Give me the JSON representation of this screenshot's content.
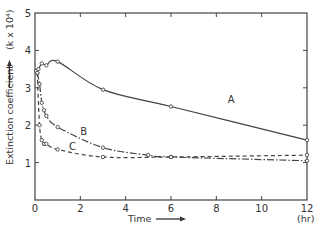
{
  "chart_data": {
    "type": "line",
    "title": "",
    "xlabel": "Time",
    "xunit": "(hr)",
    "ylabel": "Extinction coefficient",
    "yunit": "(k x 10⁴)",
    "xlim": [
      0,
      12
    ],
    "ylim": [
      0,
      5
    ],
    "xticks": [
      0,
      2,
      4,
      6,
      8,
      10,
      12
    ],
    "yticks": [
      1,
      2,
      3,
      4,
      5
    ],
    "grid": false,
    "legend": "inline curve labels",
    "series": [
      {
        "name": "A",
        "line_style": "solid",
        "x": [
          0.05,
          0.15,
          0.3,
          0.5,
          1.0,
          3.0,
          6.0,
          12.0
        ],
        "y": [
          3.45,
          3.5,
          3.65,
          3.6,
          3.7,
          2.95,
          2.5,
          1.6
        ],
        "label_pos": [
          8.5,
          2.6
        ]
      },
      {
        "name": "B",
        "line_style": "dash-dot",
        "x": [
          0.1,
          0.2,
          0.3,
          0.4,
          0.5,
          1.0,
          3.0,
          5.0,
          6.0,
          12.0
        ],
        "y": [
          3.4,
          3.1,
          2.6,
          2.4,
          2.25,
          1.95,
          1.4,
          1.2,
          1.15,
          1.05
        ],
        "label_pos": [
          2.0,
          1.75
        ]
      },
      {
        "name": "C",
        "line_style": "dashed",
        "x": [
          0.1,
          0.2,
          0.3,
          0.4,
          0.5,
          1.0,
          3.0,
          6.0,
          12.0
        ],
        "y": [
          3.4,
          2.0,
          1.6,
          1.5,
          1.5,
          1.35,
          1.15,
          1.15,
          1.2
        ],
        "label_pos": [
          1.5,
          1.35
        ]
      }
    ]
  },
  "labels": {
    "x_axis": "Time",
    "x_unit": "(hr)",
    "y_axis": "Extinction coefficient",
    "y_unit": "(k x 10⁴)",
    "curve_a": "A",
    "curve_b": "B",
    "curve_c": "C"
  }
}
